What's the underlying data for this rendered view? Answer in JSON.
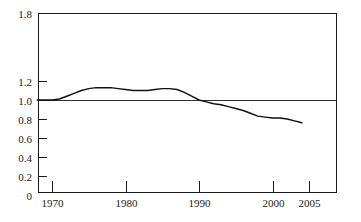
{
  "chart_data": {
    "type": "line",
    "title": "",
    "subtitle": "",
    "xlabel": "",
    "ylabel": "",
    "xlim": [
      1968,
      2006.7
    ],
    "ylim": [
      0,
      1.8
    ],
    "grid": false,
    "legend": null,
    "legend_position": "none",
    "reference_lines": [
      {
        "axis": "y",
        "value": 1.0,
        "label": ""
      }
    ],
    "y_ticks": [
      {
        "value": 0,
        "label": "0"
      },
      {
        "value": 0.2,
        "label": "0.2"
      },
      {
        "value": 0.4,
        "label": "0.4"
      },
      {
        "value": 0.6,
        "label": "0.6"
      },
      {
        "value": 0.8,
        "label": "0.8"
      },
      {
        "value": 1.0,
        "label": "1.0"
      },
      {
        "value": 1.2,
        "label": "1.2"
      },
      {
        "value": 1.8,
        "label": "1.8"
      }
    ],
    "x_ticks": [
      {
        "value": 1970,
        "label": "1970"
      },
      {
        "value": 1980,
        "label": "1980"
      },
      {
        "value": 1990,
        "label": "1990"
      },
      {
        "value": 2000,
        "label": "2000"
      },
      {
        "value": 2005,
        "label": "2005"
      }
    ],
    "series": [
      {
        "name": "index",
        "color": "#111111",
        "x": [
          1968,
          1969,
          1970,
          1971,
          1972,
          1973,
          1974,
          1975,
          1976,
          1977,
          1978,
          1979,
          1980,
          1981,
          1982,
          1983,
          1984,
          1985,
          1986,
          1987,
          1988,
          1989,
          1990,
          1991,
          1992,
          1993,
          1994,
          1995,
          1996,
          1997,
          1998,
          1999,
          2000,
          2001,
          2002,
          2003,
          2004
        ],
        "values": [
          1.0,
          1.0,
          1.0,
          1.01,
          1.04,
          1.07,
          1.1,
          1.12,
          1.13,
          1.13,
          1.13,
          1.12,
          1.11,
          1.1,
          1.1,
          1.1,
          1.11,
          1.12,
          1.12,
          1.11,
          1.08,
          1.04,
          1.0,
          0.98,
          0.96,
          0.95,
          0.93,
          0.91,
          0.89,
          0.86,
          0.83,
          0.82,
          0.81,
          0.81,
          0.8,
          0.78,
          0.76
        ]
      }
    ]
  },
  "geometry": {
    "plot_left": 38,
    "plot_right": 337,
    "plot_top": 13,
    "plot_bottom": 193,
    "x_at_1970": 52,
    "px_per_year": 7.35,
    "y_at_1p0": 100,
    "px_per_0p2": 19
  }
}
